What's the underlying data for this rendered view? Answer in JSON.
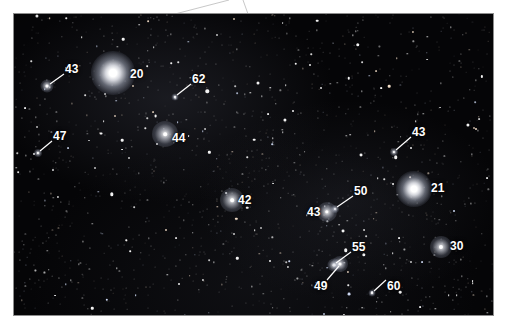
{
  "figure": {
    "kind": "astronomical-star-field-photograph",
    "background_color": "#ffffff",
    "plate_color": "#050507",
    "label_color": "#ffffff",
    "frame": {
      "x": 14,
      "y": 14,
      "width": 479,
      "height": 301
    }
  },
  "guide_lines": [
    {
      "name": "left-leader",
      "x1": 175,
      "y1": 14,
      "x2": 229,
      "y2": 0
    },
    {
      "name": "right-leader",
      "x1": 248,
      "y1": 14,
      "x2": 243,
      "y2": 0
    }
  ],
  "labels": [
    {
      "id": "43-upper-left",
      "text": "43",
      "x": 65,
      "y": 63,
      "leader": {
        "x1": 64,
        "y1": 74,
        "x2": 50,
        "y2": 84
      }
    },
    {
      "id": "20",
      "text": "20",
      "x": 130,
      "y": 68,
      "leader": null
    },
    {
      "id": "62",
      "text": "62",
      "x": 192,
      "y": 73,
      "leader": {
        "x1": 191,
        "y1": 84,
        "x2": 177,
        "y2": 95
      }
    },
    {
      "id": "47",
      "text": "47",
      "x": 53,
      "y": 130,
      "leader": {
        "x1": 52,
        "y1": 141,
        "x2": 40,
        "y2": 151
      }
    },
    {
      "id": "44",
      "text": "44",
      "x": 172,
      "y": 132,
      "leader": null
    },
    {
      "id": "43-right",
      "text": "43",
      "x": 412,
      "y": 126,
      "leader": {
        "x1": 411,
        "y1": 137,
        "x2": 396,
        "y2": 150
      }
    },
    {
      "id": "42",
      "text": "42",
      "x": 238,
      "y": 194,
      "leader": null
    },
    {
      "id": "50",
      "text": "50",
      "x": 354,
      "y": 185,
      "leader": {
        "x1": 353,
        "y1": 196,
        "x2": 337,
        "y2": 207
      }
    },
    {
      "id": "21",
      "text": "21",
      "x": 431,
      "y": 182,
      "leader": null
    },
    {
      "id": "43-lower",
      "text": "43",
      "x": 307,
      "y": 206,
      "leader": null
    },
    {
      "id": "30",
      "text": "30",
      "x": 450,
      "y": 240,
      "leader": null
    },
    {
      "id": "55",
      "text": "55",
      "x": 352,
      "y": 241,
      "leader": {
        "x1": 351,
        "y1": 252,
        "x2": 336,
        "y2": 263
      }
    },
    {
      "id": "49",
      "text": "49",
      "x": 314,
      "y": 280,
      "leader": {
        "x1": 327,
        "y1": 280,
        "x2": 339,
        "y2": 266
      }
    },
    {
      "id": "60",
      "text": "60",
      "x": 387,
      "y": 280,
      "leader": {
        "x1": 386,
        "y1": 280,
        "x2": 374,
        "y2": 291
      }
    }
  ],
  "marked_stars": [
    {
      "id": "star-43-upper-left",
      "label": "43",
      "x": 47,
      "y": 86,
      "brightness": "medium",
      "size": 3.0,
      "glow": 13
    },
    {
      "id": "star-20",
      "label": "20",
      "x": 113,
      "y": 73,
      "brightness": "very-bright",
      "size": 6.0,
      "glow": 44
    },
    {
      "id": "star-62",
      "label": "62",
      "x": 175,
      "y": 97,
      "brightness": "faint",
      "size": 2.0,
      "glow": 7
    },
    {
      "id": "star-47",
      "label": "47",
      "x": 38,
      "y": 153,
      "brightness": "faint",
      "size": 2.2,
      "glow": 8
    },
    {
      "id": "star-44",
      "label": "44",
      "x": 165,
      "y": 134,
      "brightness": "bright",
      "size": 3.6,
      "glow": 26
    },
    {
      "id": "star-43-right",
      "label": "43",
      "x": 394,
      "y": 152,
      "brightness": "faint",
      "size": 2.2,
      "glow": 8
    },
    {
      "id": "star-42",
      "label": "42",
      "x": 232,
      "y": 200,
      "brightness": "bright",
      "size": 3.6,
      "glow": 24
    },
    {
      "id": "star-50",
      "label": "50",
      "x": 335,
      "y": 209,
      "brightness": "faint",
      "size": 2.2,
      "glow": 8
    },
    {
      "id": "star-21",
      "label": "21",
      "x": 414,
      "y": 189,
      "brightness": "very-bright",
      "size": 5.4,
      "glow": 36
    },
    {
      "id": "star-43-lower",
      "label": "43",
      "x": 327,
      "y": 212,
      "brightness": "bright",
      "size": 3.4,
      "glow": 20
    },
    {
      "id": "star-30",
      "label": "30",
      "x": 441,
      "y": 247,
      "brightness": "bright",
      "size": 4.2,
      "glow": 22
    },
    {
      "id": "star-55",
      "label": "55",
      "x": 334,
      "y": 265,
      "brightness": "medium",
      "size": 2.8,
      "glow": 13
    },
    {
      "id": "star-49",
      "label": "49",
      "x": 340,
      "y": 264,
      "brightness": "medium",
      "size": 3.0,
      "glow": 16
    },
    {
      "id": "star-60",
      "label": "60",
      "x": 372,
      "y": 293,
      "brightness": "faint",
      "size": 2.0,
      "glow": 7
    }
  ],
  "field_stars_seed": 20250211,
  "field_star_count": 1500
}
